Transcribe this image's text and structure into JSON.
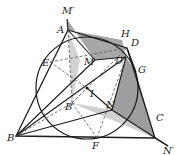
{
  "figure": {
    "type": "geometry-diagram",
    "colors": {
      "line": "#1a1a1a",
      "dash": "#555555",
      "shade_dark": "#7a7a7a",
      "shade_light": "#c4c4c4",
      "background": "#ffffff"
    },
    "labels": {
      "Mp": "M′",
      "A": "A",
      "H": "H",
      "D": "D",
      "Dp": "D′",
      "G": "G",
      "E": "E",
      "M": "M",
      "I": "I",
      "Bp": "B′",
      "N": "N",
      "B": "B",
      "F": "F",
      "C": "C",
      "Np": "N′"
    }
  }
}
